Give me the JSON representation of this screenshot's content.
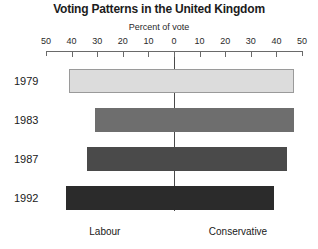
{
  "chart_data": {
    "type": "bar",
    "orientation": "horizontal-diverging",
    "title": "Voting Patterns in the United Kingdom",
    "xlabel": "Percent of vote",
    "ylabel": "",
    "grid": false,
    "legend_position": "none",
    "axis": {
      "tick_labels": [
        "50",
        "40",
        "30",
        "20",
        "10",
        "0",
        "10",
        "20",
        "30",
        "40",
        "50"
      ],
      "tick_values": [
        -50,
        -40,
        -30,
        -20,
        -10,
        0,
        10,
        20,
        30,
        40,
        50
      ],
      "xlim": [
        -50,
        50
      ],
      "left_side_label": "Labour",
      "right_side_label": "Conservative"
    },
    "categories": [
      "1979",
      "1983",
      "1987",
      "1992"
    ],
    "series": [
      {
        "name": "Labour",
        "values": [
          41,
          31,
          34,
          42
        ]
      },
      {
        "name": "Conservative",
        "values": [
          47,
          47,
          44,
          39
        ]
      }
    ],
    "bars": [
      {
        "year": "1979",
        "labour": 41,
        "conservative": 47,
        "color": "#dcdcdc",
        "outlined": true
      },
      {
        "year": "1983",
        "labour": 31,
        "conservative": 47,
        "color": "#6e6e6e",
        "outlined": false
      },
      {
        "year": "1987",
        "labour": 34,
        "conservative": 44,
        "color": "#4a4a4a",
        "outlined": false
      },
      {
        "year": "1992",
        "labour": 42,
        "conservative": 39,
        "color": "#2b2b2b",
        "outlined": false
      }
    ]
  },
  "colors": {
    "axis": "#6a6a6a",
    "zero_line": "#4a4a4a",
    "text": "#1c1c1c",
    "background": "#ffffff"
  }
}
